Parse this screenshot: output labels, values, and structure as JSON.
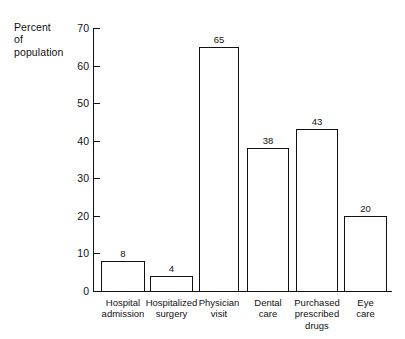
{
  "chart_data": {
    "type": "bar",
    "title": "",
    "subtitle": "",
    "xlabel": "",
    "ylabel": "Percent\nof\npopulation",
    "ylabel_lines": [
      "Percent",
      "of",
      "population"
    ],
    "categories": [
      "Hospital\nadmission",
      "Hospitalized\nsurgery",
      "Physician\nvisit",
      "Dental\ncare",
      "Purchased\nprescribed\ndrugs",
      "Eye\ncare"
    ],
    "values": [
      8,
      4,
      65,
      38,
      43,
      20
    ],
    "value_labels": [
      "8",
      "4",
      "65",
      "38",
      "43",
      "20"
    ],
    "ylim": [
      0,
      70
    ],
    "yticks": [
      0,
      10,
      20,
      30,
      40,
      50,
      60,
      70
    ],
    "ytick_labels": [
      "0",
      "10",
      "20",
      "30",
      "40",
      "50",
      "60",
      "70"
    ],
    "grid": false,
    "legend": null,
    "bar_fill": "#ffffff",
    "bar_stroke": "#111111",
    "axis_color": "#111111",
    "background": "#ffffff"
  }
}
